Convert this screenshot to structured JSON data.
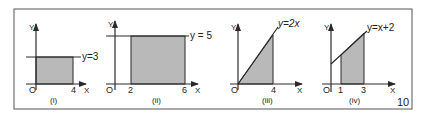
{
  "figure": {
    "number_label": "10",
    "colors": {
      "line": "#2a2a2a",
      "shade": "#b9b9b9",
      "frame": "#555555",
      "background": "#ffffff"
    }
  },
  "panels": [
    {
      "id": "i",
      "caption": "(i)",
      "equation": "y=3",
      "y_axis_label": "Y",
      "x_axis_label": "X",
      "origin_label": "O",
      "x_ticks": [
        "4"
      ]
    },
    {
      "id": "ii",
      "caption": "(ii)",
      "equation": "y = 5",
      "y_axis_label": "Y",
      "x_axis_label": "X",
      "origin_label": "O",
      "x_ticks": [
        "2",
        "6"
      ]
    },
    {
      "id": "iii",
      "caption": "(iii)",
      "equation": "y=2x",
      "y_axis_label": "Y",
      "x_axis_label": "X",
      "origin_label": "O",
      "x_ticks": [
        "4"
      ]
    },
    {
      "id": "iv",
      "caption": "(iv)",
      "equation": "y=x+2",
      "y_axis_label": "Y",
      "x_axis_label": "X",
      "origin_label": "O",
      "x_ticks": [
        "1",
        "3"
      ]
    }
  ]
}
